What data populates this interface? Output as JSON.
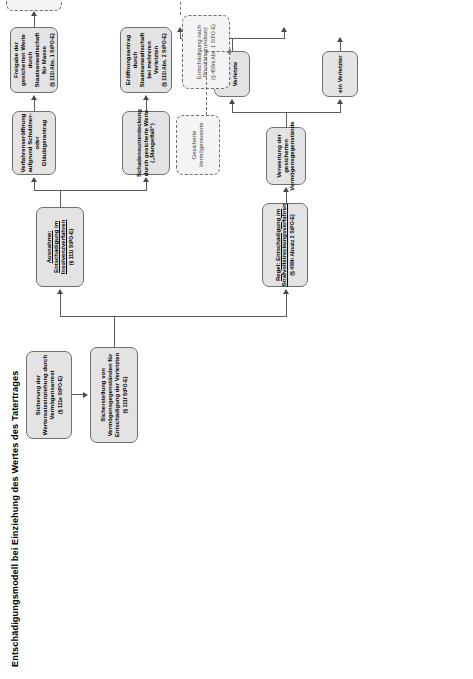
{
  "diagram": {
    "title_actual": "Entschädigungsmodell bei Einziehung des Wertes des Tatertrages",
    "type": "flowchart",
    "language": "de",
    "colors": {
      "node_fill": "#e3e3e3",
      "node_border": "#6f6f6f",
      "dashed_fill": "#f4f4f4",
      "connector": "#5b5b5b",
      "text": "#000000",
      "background": "#ffffff"
    },
    "nodes": {
      "vermoegensarrest": {
        "label": "Sicherung der Wertersatzeinziehung durch Vermögensarrest",
        "ref": "(§ 111e StPO-E)",
        "style": "solid"
      },
      "sicherstellung": {
        "label": "Sicherstellung von Vermögensgegenständen für Entschädigung der Verletzten",
        "ref": "(§ 111f StPO-E)",
        "style": "solid"
      },
      "ausnahme_insolvenz": {
        "label_prefix": "Ausnahme:",
        "label": "Ausnahme: Entschädigung im Insolvenzverfahren",
        "ref": "(§ 111i StPO-E)",
        "style": "solid"
      },
      "regel_strafvollstreckung": {
        "label_prefix": "Regel:",
        "label": "Regel: Entschädigung im Strafvollstreckungsverfahren",
        "ref": "(§ 459h Absatz 2 StPO-E)",
        "style": "solid"
      },
      "verwertung": {
        "label": "Verwertung der gesicherten Vermögensgegenstände",
        "ref": "",
        "style": "solid"
      },
      "ein_verletzter": {
        "label": "ein Verletzter",
        "ref": "",
        "style": "solid"
      },
      "mehrere_verletzte": {
        "label": "mehrere Verletzte",
        "ref": "",
        "style": "solid"
      },
      "schadensdeckung": {
        "label": "Schadensdeckung durch gesicherte Werte",
        "ref": "",
        "style": "solid"
      },
      "auskehrung": {
        "label": "Auskehrung des Verwertungserlöses",
        "ref": "(§ 459h Abs. 2 S. 1 StPO-E)",
        "style": "solid"
      },
      "schadensunterdeckung_unten": {
        "label": "Schadensunterdeckung durch gesicherte Werte („Mangelfall“)",
        "ref": "",
        "style": "solid"
      },
      "entschaedigung_insolvenz_unten": {
        "label": "Entschädigung im Insolvenzverfahren",
        "ref": "(§ 459h Abs. 2 S. 2 StPO-E)",
        "style": "solid"
      },
      "schadensunterdeckung_oben": {
        "label": "Schadensunterdeckung durch gesicherte Werte („Mangelfall“)",
        "ref": "",
        "style": "solid"
      },
      "eroeffnungsantrag": {
        "label": "Eröffnungsantrag durch Staatsanwaltschaft bei mehreren Verletzten",
        "ref": "(§ 111i Abs. 2 StPO-E)",
        "style": "solid"
      },
      "eroeffnung": {
        "label": "Eröffnung",
        "ref": "",
        "style": "solid"
      },
      "ablehnung": {
        "label": "Ablehnung",
        "ref": "",
        "style": "solid"
      },
      "gesicherte_vermoegenswerte": {
        "label": "Gesicherte Vermögenswerte",
        "ref": "",
        "style": "dashed"
      },
      "entschaedigung_prioritaet": {
        "label": "Entschädigung nach Prioritätsgrundsatz",
        "ref": "(§ 459m Abs. 1 StPO-E)",
        "style": "dashed"
      },
      "verfahrenseroeffnung": {
        "label": "Verfahrenseröffnung aufgrund Schuldner- oder Gläubigerantrag",
        "ref": "",
        "style": "solid"
      },
      "freigabe": {
        "label": "Freigabe der gesicherten Werte durch Staatsanwaltschaft für Masse",
        "ref": "(§ 111i Abs. 1 StPO-E)",
        "style": "solid"
      },
      "entschaedigung_insolvenz_oben": {
        "label": "Entschädigung im Insolvenzverfahren",
        "ref": "",
        "style": "solid"
      },
      "ueberschuss": {
        "label": "Überschuss nach Schlussverteilung",
        "ref": "(nach vollständiger Befriedigung aller Insolvenzgläubiger)",
        "style": "dashed"
      }
    }
  }
}
